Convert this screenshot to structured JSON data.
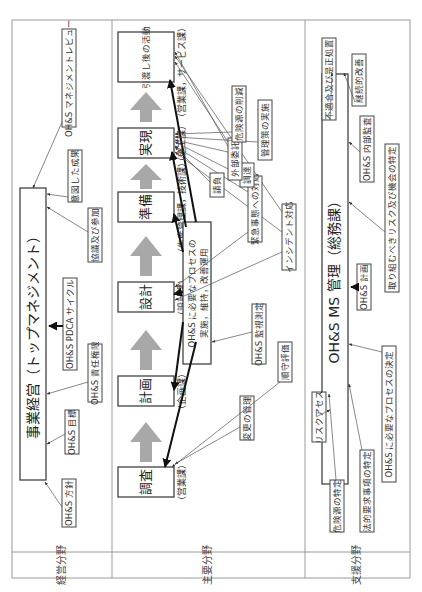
{
  "sections": {
    "management": "経営分野",
    "main": "主要分野",
    "support": "支援分野"
  },
  "management": {
    "box": "事業経営（トップマネジメント）",
    "labels": {
      "policy": "OH&S 方針",
      "objectives": "OH&S 目標",
      "responsibility": "OH&S 責任権限",
      "pdca": "OH&S PDCA サイクル",
      "consultation": "協議及び参加",
      "intended_results": "意図した成果",
      "review": "OH&S マネジメントレビュー"
    }
  },
  "main": {
    "process_box": "OH&S に必要なプロセスの実施，維持，改善運用",
    "stages": [
      {
        "label": "調査",
        "dept": "（営業課）"
      },
      {
        "label": "計画",
        "dept": "（企画課）"
      },
      {
        "label": "設計",
        "dept": "（設計課）"
      },
      {
        "label": "準備",
        "dept": "（生産管理課，技術課）"
      },
      {
        "label": "実現",
        "dept": "（施工課）"
      },
      {
        "label": "引渡し後の活動",
        "dept": "（営業課，サービス課）"
      }
    ],
    "labels": {
      "change_mgmt": "変更の管理",
      "compliance": "順守評価",
      "monitoring": "OH&S 監視測定",
      "incident": "インシデント対応",
      "emergency": "緊急事態への対応",
      "procurement": "調達",
      "contracting": "請負",
      "outsourcing": "外部委託",
      "controls": "管理策の実施",
      "hazard_reduction": "危険源の削減"
    }
  },
  "support": {
    "box": "OH&S MS 管理（総務課）",
    "labels": {
      "risk_assessment": "リスクアセス",
      "hazard_id": "危険源の特定",
      "legal_req": "法的要求事項の特定",
      "processes": "OH&S に必要なプロセスの決定",
      "planning": "OH&S 計画",
      "risks_opps": "取り組むべきリスク及び機会の特定",
      "internal_audit": "OH&S 内部監査",
      "continual_improvement": "継続的改善",
      "nonconformity": "不適合及び是正処置"
    }
  }
}
